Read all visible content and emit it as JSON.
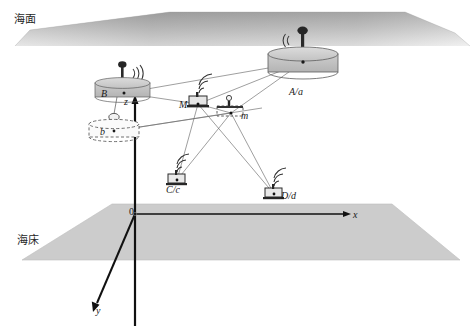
{
  "figure": {
    "type": "underwater-acoustic-positioning-schematic",
    "background_color": "#ffffff",
    "line_color": "#5a5a5a",
    "axis_color": "#111111",
    "fill_color": "#cccccc"
  },
  "environment": {
    "sea_surface": {
      "label": "海面",
      "meaning": "sea surface",
      "label_x": 27,
      "label_y": 18
    },
    "seabed": {
      "label": "海床",
      "meaning": "seabed",
      "label_x": 30,
      "label_y": 238
    }
  },
  "axes": {
    "origin": {
      "label": "0",
      "x": 133,
      "y": 215
    },
    "items": [
      {
        "name": "z-axis",
        "label": "z",
        "label_x": 127,
        "label_y": 104,
        "direction": "up"
      },
      {
        "name": "x-axis",
        "label": "x",
        "label_x": 355,
        "label_y": 217,
        "direction": "right"
      },
      {
        "name": "y-axis",
        "label": "y",
        "label_x": 99,
        "label_y": 313,
        "direction": "down-left"
      }
    ]
  },
  "nodes": [
    {
      "id": "B",
      "label": "B",
      "kind": "surface-buoy",
      "label_x": 104,
      "label_y": 96,
      "anchor_x": 124,
      "anchor_y": 93,
      "has_antenna": true,
      "has_radio_waves": true
    },
    {
      "id": "b",
      "label": "b",
      "kind": "submerged-transducer",
      "label_x": 103,
      "label_y": 134,
      "anchor_x": 114,
      "anchor_y": 131,
      "dashed_outline": true
    },
    {
      "id": "A/a",
      "label": "A/a",
      "kind": "surface-buoy",
      "label_x": 291,
      "label_y": 95,
      "anchor_x": 303,
      "anchor_y": 62,
      "has_antenna": true,
      "has_radio_waves": true
    },
    {
      "id": "M",
      "label": "M",
      "kind": "vehicle-master",
      "label_x": 182,
      "label_y": 107,
      "anchor_x": 198,
      "anchor_y": 104,
      "has_radio_waves": true
    },
    {
      "id": "m",
      "label": "m",
      "kind": "vehicle-slave",
      "label_x": 243,
      "label_y": 118,
      "anchor_x": 231,
      "anchor_y": 113,
      "dashed_outline": true
    },
    {
      "id": "C/c",
      "label": "C/c",
      "kind": "seabed-beacon",
      "label_x": 168,
      "label_y": 192,
      "anchor_x": 177,
      "anchor_y": 180,
      "has_radio_waves": true
    },
    {
      "id": "D/d",
      "label": "D/d",
      "kind": "seabed-beacon",
      "label_x": 283,
      "label_y": 198,
      "anchor_x": 274,
      "anchor_y": 194,
      "has_radio_waves": true
    }
  ],
  "links": [
    {
      "from": "B",
      "to": "A/a"
    },
    {
      "from": "B",
      "to": "M"
    },
    {
      "from": "b",
      "to": "m"
    },
    {
      "from": "M",
      "to": "A/a"
    },
    {
      "from": "m",
      "to": "A/a"
    },
    {
      "from": "M",
      "to": "m"
    },
    {
      "from": "M",
      "to": "C/c"
    },
    {
      "from": "M",
      "to": "D/d"
    },
    {
      "from": "m",
      "to": "C/c"
    },
    {
      "from": "m",
      "to": "D/d"
    }
  ]
}
